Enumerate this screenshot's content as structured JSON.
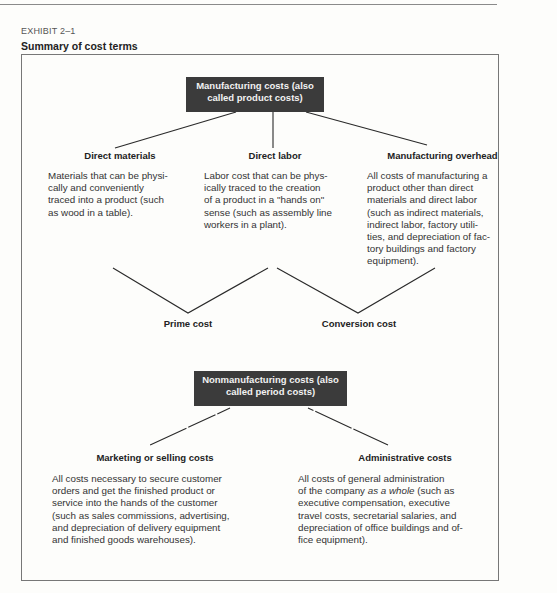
{
  "exhibit": {
    "label": "EXHIBIT 2–1",
    "title": "Summary of cost terms"
  },
  "manufacturing": {
    "box_line1": "Manufacturing costs (also",
    "box_line2": "called product costs)",
    "categories": [
      {
        "heading": "Direct materials",
        "lines": [
          "Materials that can be physi-",
          "cally and conveniently",
          "traced into a product (such",
          "as wood in a table)."
        ]
      },
      {
        "heading": "Direct labor",
        "lines": [
          "Labor cost that can be phys-",
          "ically traced to the creation",
          "of a product in a \"hands on\"",
          "sense (such as assembly line",
          "workers in a plant)."
        ]
      },
      {
        "heading": "Manufacturing overhead",
        "lines": [
          "All costs of manufacturing a",
          "product other than direct",
          "materials and direct labor",
          "(such as indirect materials,",
          "indirect labor, factory utili-",
          "ties, and depreciation of fac-",
          "tory buildings and factory",
          "equipment)."
        ]
      }
    ],
    "combinations": {
      "prime_cost": "Prime cost",
      "conversion_cost": "Conversion cost"
    }
  },
  "nonmanufacturing": {
    "box_line1": "Nonmanufacturing costs (also",
    "box_line2": "called period costs)",
    "categories": [
      {
        "heading": "Marketing or selling costs",
        "lines": [
          "All costs necessary to secure customer",
          "orders and get the finished product or",
          "service into the hands of the customer",
          "(such as sales commissions, advertising,",
          "and depreciation of delivery equipment",
          "and finished goods warehouses)."
        ]
      },
      {
        "heading": "Administrative costs",
        "line1_pre": "All costs of general administration",
        "line2_pre": "of the company ",
        "line2_em": "as a whole",
        "line2_post": " (such as",
        "lines_rest": [
          "executive compensation, executive",
          "travel costs, secretarial salaries, and",
          "depreciation of office buildings and of-",
          "fice equipment)."
        ]
      }
    ]
  },
  "colors": {
    "box_fill": "#3b3b3b",
    "box_text": "#f2f2f2",
    "line": "#2a2a2a",
    "frame": "#777777"
  }
}
